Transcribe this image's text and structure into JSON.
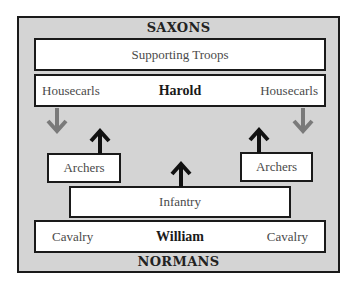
{
  "diagram": {
    "top_label": "SAXONS",
    "bottom_label": "NORMANS",
    "supporting": "Supporting Troops",
    "saxon_row": {
      "left": "Housecarls",
      "center": "Harold",
      "right": "Housecarls"
    },
    "archers_left": "Archers",
    "archers_right": "Archers",
    "infantry": "Infantry",
    "norman_row": {
      "left": "Cavalry",
      "center": "William",
      "right": "Cavalry"
    },
    "colors": {
      "frame_bg": "#d4d4d4",
      "border": "#1a1a1a",
      "gray_arrow": "#7a7a7a",
      "black_arrow": "#111111"
    },
    "arrows": [
      {
        "name": "housecarls-left-down",
        "color": "gray",
        "direction": "down"
      },
      {
        "name": "housecarls-right-down",
        "color": "gray",
        "direction": "down"
      },
      {
        "name": "archers-left-up",
        "color": "black",
        "direction": "up"
      },
      {
        "name": "archers-right-up",
        "color": "black",
        "direction": "up"
      },
      {
        "name": "infantry-up",
        "color": "black",
        "direction": "up"
      }
    ]
  }
}
